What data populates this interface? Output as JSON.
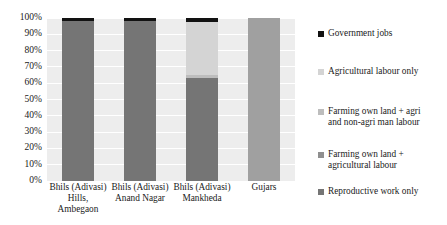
{
  "chart_data": {
    "type": "bar",
    "subtype": "stacked-percent",
    "title": "",
    "xlabel": "",
    "ylabel": "",
    "ylim": [
      0,
      100
    ],
    "grid": true,
    "legend_position": "right",
    "categories": [
      "Bhils (Adivasi)\nHills,\nAmbegaon",
      "Bhils (Adivasi)\nAnand Nagar",
      "Bhils (Adivasi)\nMankheda",
      "Gujars"
    ],
    "ytick_labels": [
      "100%",
      "90%",
      "80%",
      "70%",
      "60%",
      "50%",
      "40%",
      "30%",
      "20%",
      "10%",
      "0%"
    ],
    "ytick_values": [
      100,
      90,
      80,
      70,
      60,
      50,
      40,
      30,
      20,
      10,
      0
    ],
    "series": [
      {
        "name": "Government jobs",
        "color": "#121212",
        "values": [
          2,
          2,
          3,
          0
        ]
      },
      {
        "name": "Agricultural labour only",
        "color": "#d4d4d4",
        "values": [
          0,
          0,
          32,
          0
        ]
      },
      {
        "name": "Farming own land + agri\nand non-agri man labour",
        "color": "#bdbdbd",
        "values": [
          0,
          0,
          2,
          0
        ]
      },
      {
        "name": "Farming own land +\nagricultural labour",
        "color": "#8f8f8f",
        "values": [
          0,
          0,
          0,
          0
        ]
      },
      {
        "name": "Reproductive work only",
        "color": "#757575",
        "values": [
          98,
          98,
          63,
          100
        ]
      }
    ],
    "bar_fill_overrides": {
      "3": "#a0a0a0"
    }
  }
}
